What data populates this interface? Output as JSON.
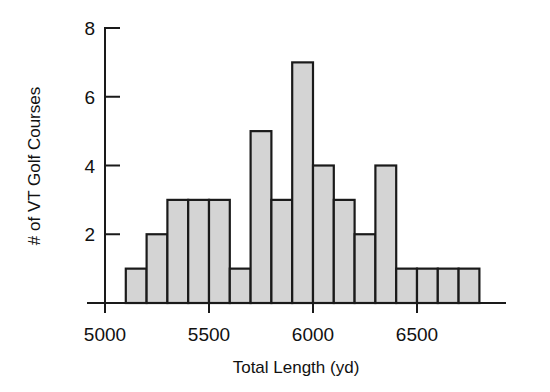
{
  "chart_data": {
    "type": "bar",
    "title": "",
    "subtitle": "",
    "xlabel": "Total Length (yd)",
    "ylabel": "# of VT Golf Courses",
    "grid": false,
    "legend": null,
    "bin_width": 100,
    "xlim": [
      5000,
      6800
    ],
    "ylim": [
      0,
      8
    ],
    "x_ticks": [
      5000,
      5500,
      6000,
      6500
    ],
    "x_tick_labels": [
      "5000",
      "5500",
      "6000",
      "6500"
    ],
    "y_ticks": [
      2,
      4,
      6,
      8
    ],
    "y_tick_labels": [
      "2",
      "4",
      "6",
      "8"
    ],
    "bin_edges": [
      5100,
      5200,
      5300,
      5400,
      5500,
      5600,
      5700,
      5800,
      5900,
      6000,
      6100,
      6200,
      6300,
      6400,
      6500,
      6600,
      6700,
      6800
    ],
    "categories": [
      "5100-5200",
      "5200-5300",
      "5300-5400",
      "5400-5500",
      "5500-5600",
      "5600-5700",
      "5700-5800",
      "5800-5900",
      "5900-6000",
      "6000-6100",
      "6100-6200",
      "6200-6300",
      "6300-6400",
      "6400-6500",
      "6500-6600",
      "6600-6700",
      "6700-6800"
    ],
    "values": [
      1,
      2,
      3,
      3,
      3,
      1,
      5,
      3,
      7,
      4,
      3,
      2,
      4,
      1,
      1,
      1,
      1
    ],
    "total_count": 36,
    "bar_fill_color": "#d4d4d4",
    "bar_edge_color": "#1a1a1a",
    "background_color": "#ffffff"
  }
}
